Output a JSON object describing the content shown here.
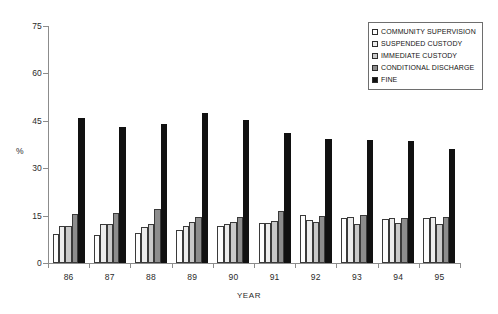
{
  "chart_data": {
    "type": "bar",
    "title": "",
    "xlabel": "YEAR",
    "ylabel": "%",
    "ylim": [
      0,
      75
    ],
    "yticks": [
      0,
      15,
      30,
      45,
      60,
      75
    ],
    "grid": false,
    "legend_position": "top-right",
    "categories": [
      "86",
      "87",
      "88",
      "89",
      "90",
      "91",
      "92",
      "93",
      "94",
      "95"
    ],
    "series": [
      {
        "name": "COMMUNITY SUPERVISION",
        "swatch": "#fdfdfd",
        "values": [
          9.3,
          8.8,
          9.5,
          10.3,
          11.6,
          12.7,
          15.2,
          14.2,
          14.0,
          14.2
        ]
      },
      {
        "name": "SUSPENDED CUSTODY",
        "swatch": "#ececec",
        "values": [
          11.8,
          12.5,
          11.4,
          11.8,
          12.3,
          12.6,
          13.6,
          14.6,
          14.4,
          14.6
        ]
      },
      {
        "name": "IMMEDIATE CUSTODY",
        "swatch": "#c9c9c9",
        "values": [
          11.6,
          12.2,
          12.5,
          12.9,
          13.1,
          13.2,
          12.9,
          12.4,
          12.6,
          12.4
        ]
      },
      {
        "name": "CONDITIONAL DISCHARGE",
        "swatch": "#8d8d8d",
        "values": [
          15.4,
          15.9,
          17.2,
          14.7,
          14.5,
          16.4,
          14.9,
          15.3,
          14.4,
          14.6
        ]
      },
      {
        "name": "FINE",
        "swatch": "#111111",
        "values": [
          46.0,
          43.0,
          44.0,
          47.6,
          45.2,
          41.2,
          39.2,
          39.0,
          38.5,
          36.2
        ]
      }
    ]
  }
}
